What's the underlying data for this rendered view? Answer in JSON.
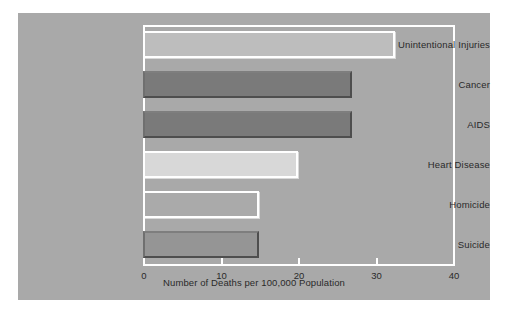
{
  "chart_data": {
    "type": "bar",
    "orientation": "horizontal",
    "title": "",
    "xlabel": "Number of Deaths per 100,000 Population",
    "ylabel": "",
    "categories": [
      "Unintentional Injuries",
      "Cancer",
      "AIDS",
      "Heart Disease",
      "Homicide",
      "Suicide"
    ],
    "values": [
      32.5,
      27,
      27,
      20,
      15,
      15
    ],
    "xlim": [
      0,
      40
    ],
    "xticks": [
      0,
      10,
      20,
      30,
      40
    ],
    "xtick_labels": [
      "0",
      "10",
      "20",
      "30",
      "40"
    ],
    "grid": false,
    "legend": null,
    "bar_colors": [
      "#bdbdbd",
      "#7a7a7a",
      "#7a7a7a",
      "#d8d8d8",
      "#aaaaaa",
      "#959595"
    ],
    "bar_edge_styles": [
      "light",
      "dark",
      "dark",
      "light",
      "light",
      "dark"
    ]
  },
  "figure": {
    "background_color": "#a9a9a9",
    "axis_color": "#ffffff",
    "text_color": "#2a2a2a"
  }
}
